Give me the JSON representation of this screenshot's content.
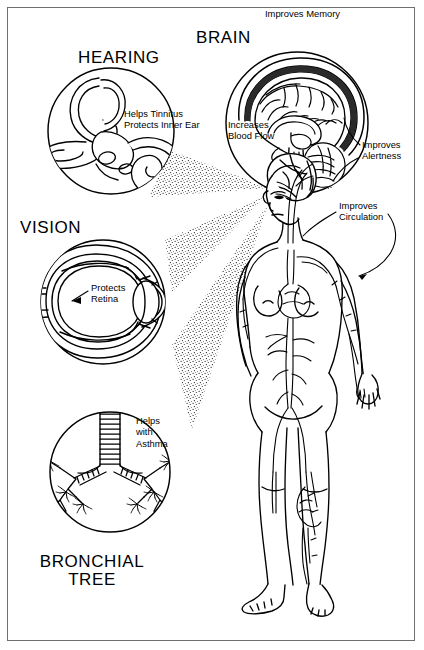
{
  "poster": {
    "title_hearing": "HEARING",
    "title_brain": "BRAIN",
    "title_vision": "VISION",
    "title_bronchial": "BRONCHIAL\nTREE",
    "border_color": "#6f6f6f",
    "ink_color": "#000000",
    "background": "#ffffff"
  },
  "callouts": {
    "improves_memory": "Improves Memory",
    "increases_blood_flow": "Increases\nBlood Flow",
    "improves_alertness": "Improves\nAlertness",
    "improves_circulation": "Improves\nCirculation",
    "helps_tinnitus": "Helps Tinnitus\nProtects Inner Ear",
    "protects_retina": "Protects\nRetina",
    "helps_with_asthma": "Helps\nwith\nAsthma"
  },
  "organs": [
    {
      "name": "inner-ear",
      "heading": "HEARING",
      "benefit": "Helps Tinnitus / Protects Inner Ear"
    },
    {
      "name": "brain",
      "heading": "BRAIN",
      "benefit": "Improves Memory / Increases Blood Flow / Improves Alertness"
    },
    {
      "name": "eye",
      "heading": "VISION",
      "benefit": "Protects Retina"
    },
    {
      "name": "bronchial-tree",
      "heading": "BRONCHIAL TREE",
      "benefit": "Helps with Asthma"
    },
    {
      "name": "circulatory-system",
      "heading": "",
      "benefit": "Improves Circulation"
    }
  ]
}
